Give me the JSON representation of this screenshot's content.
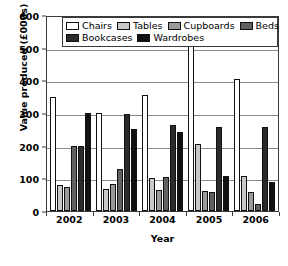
{
  "chart_data": {
    "type": "bar",
    "title": "",
    "xlabel": "Year",
    "ylabel": "Value produced (£000s)",
    "categories": [
      "2002",
      "2003",
      "2004",
      "2005",
      "2006"
    ],
    "ylim": [
      0,
      600
    ],
    "yticks": [
      0,
      100,
      200,
      300,
      400,
      500,
      600
    ],
    "ytick_labels": [
      "0",
      "100",
      "200",
      "300",
      "400",
      "500",
      "600"
    ],
    "grid": true,
    "legend_position": "top",
    "series": [
      {
        "name": "Chairs",
        "color": "#ffffff",
        "values": [
          350,
          300,
          355,
          510,
          405
        ]
      },
      {
        "name": "Tables",
        "color": "#c8c8c8",
        "values": [
          80,
          68,
          102,
          205,
          107
        ]
      },
      {
        "name": "Cupboards",
        "color": "#9a9a9a",
        "values": [
          75,
          83,
          63,
          60,
          58
        ]
      },
      {
        "name": "Beds",
        "color": "#616161",
        "values": [
          200,
          130,
          103,
          57,
          20
        ]
      },
      {
        "name": "Bookcases",
        "color": "#2b2b2b",
        "values": [
          200,
          297,
          262,
          256,
          258
        ]
      },
      {
        "name": "Wardrobes",
        "color": "#111111",
        "values": [
          300,
          252,
          242,
          106,
          90
        ]
      }
    ]
  },
  "legend": {
    "rows": [
      [
        "Chairs",
        "Tables",
        "Cupboards",
        "Beds"
      ],
      [
        "Bookcases",
        "Wardrobes"
      ]
    ]
  }
}
